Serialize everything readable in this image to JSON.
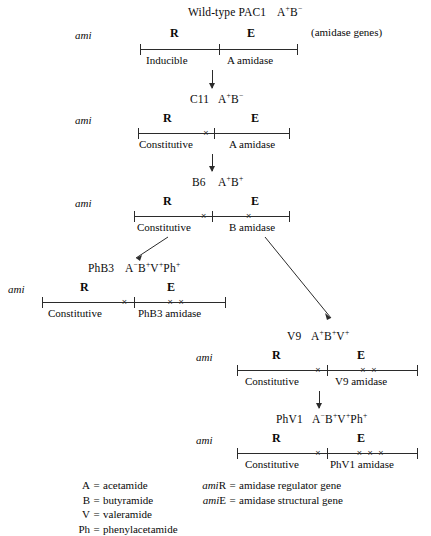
{
  "diagram": {
    "title_note": "(amidase genes)",
    "ami_label": "ami",
    "gene_left": "R",
    "gene_right": "E",
    "xmark_glyph": "×"
  },
  "stages": [
    {
      "id": "pac1",
      "strain": "Wild-type PAC1",
      "phenotype": [
        {
          "base": "A",
          "sup": "+"
        },
        {
          "base": "B",
          "sup": "−"
        }
      ],
      "left_caption": "Inducible",
      "right_caption": "A amidase",
      "r_mutations": 0,
      "e_mutations": 0
    },
    {
      "id": "c11",
      "strain": "C11",
      "phenotype": [
        {
          "base": "A",
          "sup": "+"
        },
        {
          "base": "B",
          "sup": "−"
        }
      ],
      "left_caption": "Constitutive",
      "right_caption": "A amidase",
      "r_mutations": 1,
      "e_mutations": 0
    },
    {
      "id": "b6",
      "strain": "B6",
      "phenotype": [
        {
          "base": "A",
          "sup": "+"
        },
        {
          "base": "B",
          "sup": "+"
        }
      ],
      "left_caption": "Constitutive",
      "right_caption": "B amidase",
      "r_mutations": 1,
      "e_mutations": 1
    },
    {
      "id": "phb3",
      "strain": "PhB3",
      "phenotype": [
        {
          "base": "A",
          "sup": "−"
        },
        {
          "base": "B",
          "sup": "+"
        },
        {
          "base": "V",
          "sup": "+"
        },
        {
          "base": "Ph",
          "sup": "+"
        }
      ],
      "left_caption": "Constitutive",
      "right_caption": "PhB3 amidase",
      "r_mutations": 1,
      "e_mutations": 2
    },
    {
      "id": "v9",
      "strain": "V9",
      "phenotype": [
        {
          "base": "A",
          "sup": "+"
        },
        {
          "base": "B",
          "sup": "+"
        },
        {
          "base": "V",
          "sup": "+"
        }
      ],
      "left_caption": "Constitutive",
      "right_caption": "V9 amidase",
      "r_mutations": 1,
      "e_mutations": 2
    },
    {
      "id": "phv1",
      "strain": "PhV1",
      "phenotype": [
        {
          "base": "A",
          "sup": "−"
        },
        {
          "base": "B",
          "sup": "+"
        },
        {
          "base": "V",
          "sup": "+"
        },
        {
          "base": "Ph",
          "sup": "+"
        }
      ],
      "left_caption": "Constitutive",
      "right_caption": "PhV1 amidase",
      "r_mutations": 1,
      "e_mutations": 3
    }
  ],
  "legend_left": [
    {
      "key": "A",
      "eq": "=",
      "value": "acetamide"
    },
    {
      "key": "B",
      "eq": "=",
      "value": "butyramide"
    },
    {
      "key": "V",
      "eq": "=",
      "value": "valeramide"
    },
    {
      "key": "Ph",
      "eq": "=",
      "value": "phenylacetamide"
    }
  ],
  "legend_right": [
    {
      "italic": "ami",
      "roman": "R",
      "eq": "=",
      "value": "amidase regulator gene"
    },
    {
      "italic": "ami",
      "roman": "E",
      "eq": "=",
      "value": "amidase structural gene"
    }
  ],
  "colors": {
    "ink": "#0a0a0a",
    "line": "#2b2b2b",
    "background": "#ffffff"
  }
}
